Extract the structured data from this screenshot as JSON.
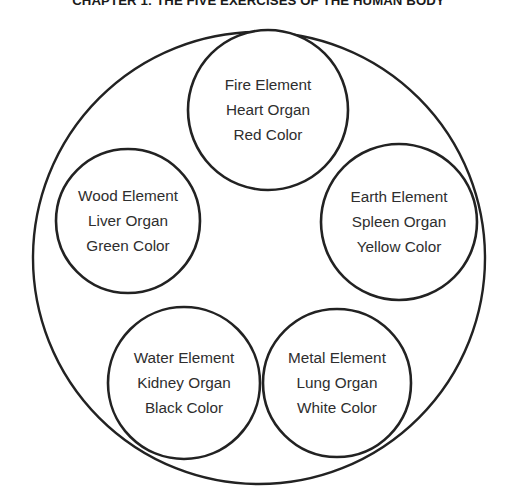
{
  "page": {
    "background_color": "#ffffff",
    "stroke_color": "#222222",
    "text_color": "#2e2e2e"
  },
  "heading": {
    "text": "CHAPTER 1: THE FIVE EXERCISES OF THE HUMAN BODY"
  },
  "diagram": {
    "name": "five-elements-wheel",
    "outer_circle": {
      "cx": 259,
      "cy": 258,
      "r": 226
    },
    "nodes": [
      {
        "id": "fire",
        "element_line": "Fire Element",
        "organ_line": "Heart Organ",
        "color_line": "Red Color",
        "color_hex": "#d42a2a",
        "cx": 268,
        "cy": 110,
        "r": 80
      },
      {
        "id": "earth",
        "element_line": "Earth Element",
        "organ_line": "Spleen Organ",
        "color_line": "Yellow Color",
        "color_hex": "#e2c018",
        "cx": 399,
        "cy": 222,
        "r": 78
      },
      {
        "id": "metal",
        "element_line": "Metal Element",
        "organ_line": "Lung Organ",
        "color_line": "White Color",
        "color_hex": "#ffffff",
        "cx": 337,
        "cy": 383,
        "r": 74
      },
      {
        "id": "water",
        "element_line": "Water Element",
        "organ_line": "Kidney Organ",
        "color_line": "Black Color",
        "color_hex": "#111111",
        "cx": 184,
        "cy": 383,
        "r": 76
      },
      {
        "id": "wood",
        "element_line": "Wood Element",
        "organ_line": "Liver Organ",
        "color_line": "Green Color",
        "color_hex": "#2e9c3a",
        "cx": 128,
        "cy": 221,
        "r": 72
      }
    ]
  }
}
